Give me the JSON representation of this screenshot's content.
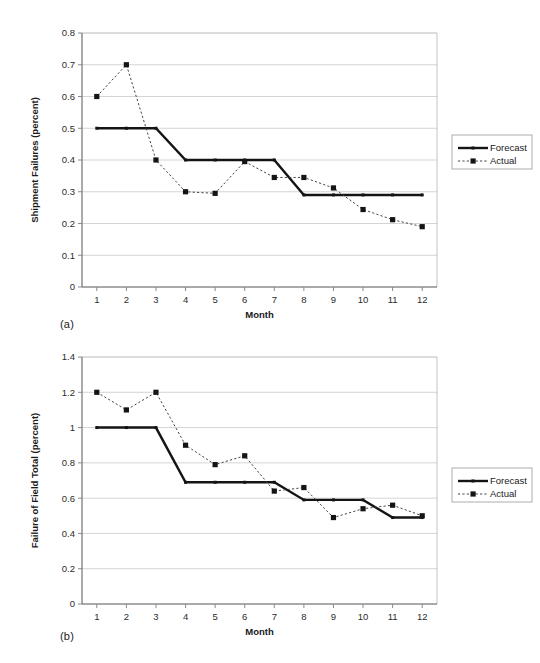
{
  "chart_data": [
    {
      "type": "line",
      "panel": "(a)",
      "title": "",
      "xlabel": "Month",
      "ylabel": "Shipment Failures (percent)",
      "x": [
        1,
        2,
        3,
        4,
        5,
        6,
        7,
        8,
        9,
        10,
        11,
        12
      ],
      "xticklabels": [
        "1",
        "2",
        "3",
        "4",
        "5",
        "6",
        "7",
        "8",
        "9",
        "10",
        "11",
        "12"
      ],
      "yticklabels": [
        "0",
        "0.1",
        "0.2",
        "0.3",
        "0.4",
        "0.5",
        "0.6",
        "0.7",
        "0.8"
      ],
      "yticks": [
        0,
        0.1,
        0.2,
        0.3,
        0.4,
        0.5,
        0.6,
        0.7,
        0.8
      ],
      "ylim": [
        0,
        0.8
      ],
      "xlim": [
        0.5,
        12.5
      ],
      "grid": "horizontal",
      "legend_position": "right",
      "series": [
        {
          "name": "Forecast",
          "style": "solid",
          "marker": "none",
          "values": [
            0.5,
            0.5,
            0.5,
            0.4,
            0.4,
            0.4,
            0.4,
            0.29,
            0.29,
            0.29,
            0.29,
            0.29
          ]
        },
        {
          "name": "Actual",
          "style": "dotted",
          "marker": "square",
          "values": [
            0.6,
            0.7,
            0.4,
            0.3,
            0.295,
            0.395,
            0.345,
            0.345,
            0.312,
            0.244,
            0.212,
            0.19
          ]
        }
      ]
    },
    {
      "type": "line",
      "panel": "(b)",
      "title": "",
      "xlabel": "Month",
      "ylabel": "Failure of Field Total (percent)",
      "x": [
        1,
        2,
        3,
        4,
        5,
        6,
        7,
        8,
        9,
        10,
        11,
        12
      ],
      "xticklabels": [
        "1",
        "2",
        "3",
        "4",
        "5",
        "6",
        "7",
        "8",
        "9",
        "10",
        "11",
        "12"
      ],
      "yticklabels": [
        "0",
        "0.2",
        "0.4",
        "0.6",
        "0.8",
        "1",
        "1.2",
        "1.4"
      ],
      "yticks": [
        0,
        0.2,
        0.4,
        0.6,
        0.8,
        1.0,
        1.2,
        1.4
      ],
      "ylim": [
        0,
        1.4
      ],
      "xlim": [
        0.5,
        12.5
      ],
      "grid": "horizontal",
      "legend_position": "right",
      "series": [
        {
          "name": "Forecast",
          "style": "solid",
          "marker": "none",
          "values": [
            1.0,
            1.0,
            1.0,
            0.69,
            0.69,
            0.69,
            0.69,
            0.59,
            0.59,
            0.59,
            0.49,
            0.49
          ]
        },
        {
          "name": "Actual",
          "style": "dotted",
          "marker": "square",
          "values": [
            1.2,
            1.1,
            1.2,
            0.9,
            0.79,
            0.84,
            0.64,
            0.66,
            0.49,
            0.54,
            0.56,
            0.5
          ]
        }
      ]
    }
  ],
  "figures": {
    "a": {
      "caption": "(a)",
      "ylabel": "Shipment Failures (percent)",
      "xlabel": "Month",
      "legend": {
        "forecast": "Forecast",
        "actual": "Actual"
      }
    },
    "b": {
      "caption": "(b)",
      "ylabel": "Failure of Field Total (percent)",
      "xlabel": "Month",
      "legend": {
        "forecast": "Forecast",
        "actual": "Actual"
      }
    }
  },
  "colors": {
    "forecast_line": "#141414",
    "actual_line": "#444444",
    "gridline": "#c9c9c9",
    "axis": "#8a8a8a",
    "text": "#1a1a1a",
    "background": "#ffffff"
  }
}
